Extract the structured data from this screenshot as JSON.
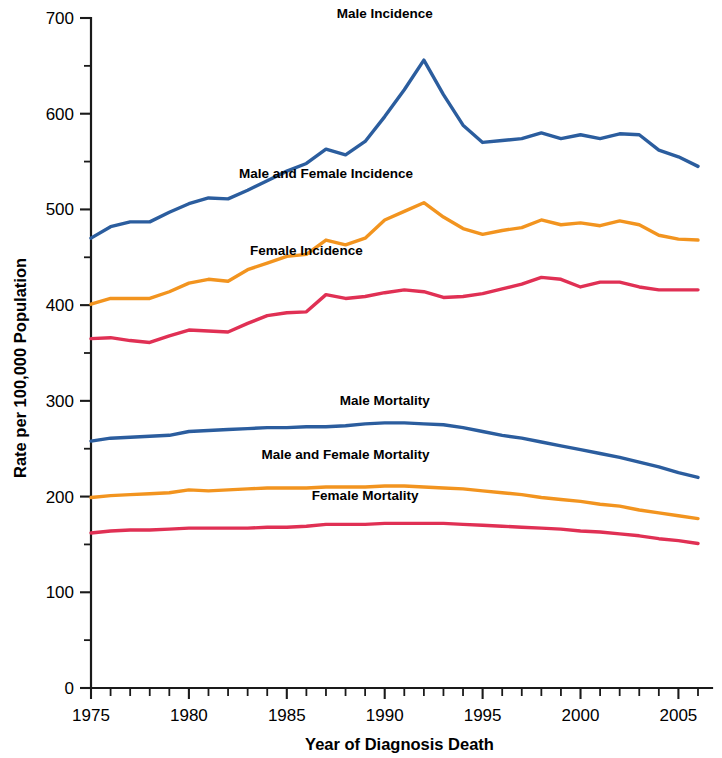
{
  "chart_data": {
    "type": "line",
    "title": "",
    "xlabel": "Year of Diagnosis Death",
    "ylabel": "Rate per 100,000 Population",
    "xlim": [
      1975,
      2006
    ],
    "ylim": [
      0,
      700
    ],
    "ytick_step": 100,
    "yticks": [
      0,
      100,
      200,
      300,
      400,
      500,
      600,
      700
    ],
    "yticklabels": [
      "0",
      "100",
      "200",
      "300",
      "400",
      "500",
      "600",
      "700"
    ],
    "yminor_step": 50,
    "xticks": [
      1975,
      1980,
      1985,
      1990,
      1995,
      2000,
      2005
    ],
    "xticklabels": [
      "1975",
      "1980",
      "1985",
      "1990",
      "1995",
      "2000",
      "2005"
    ],
    "xminor_step": 1,
    "grid": false,
    "legend": "inline-annotations",
    "x": [
      1975,
      1976,
      1977,
      1978,
      1979,
      1980,
      1981,
      1982,
      1983,
      1984,
      1985,
      1986,
      1987,
      1988,
      1989,
      1990,
      1991,
      1992,
      1993,
      1994,
      1995,
      1996,
      1997,
      1998,
      1999,
      2000,
      2001,
      2002,
      2003,
      2004,
      2005,
      2006
    ],
    "series": [
      {
        "name": "Male Incidence",
        "color": "#2b5d9e",
        "label_x": 1990,
        "label_y": 700,
        "values": [
          470,
          482,
          487,
          487,
          497,
          506,
          512,
          511,
          520,
          530,
          540,
          548,
          563,
          557,
          571,
          597,
          625,
          656,
          620,
          588,
          570,
          572,
          574,
          580,
          574,
          578,
          574,
          579,
          578,
          562,
          555,
          545
        ]
      },
      {
        "name": "Male and Female Incidence",
        "color": "#f2941f",
        "label_x": 1987,
        "label_y": 533,
        "values": [
          401,
          407,
          407,
          407,
          414,
          423,
          427,
          425,
          437,
          444,
          451,
          453,
          468,
          463,
          470,
          489,
          498,
          507,
          492,
          480,
          474,
          478,
          481,
          489,
          484,
          486,
          483,
          488,
          484,
          473,
          469,
          468
        ]
      },
      {
        "name": "Female Incidence",
        "color": "#e03054",
        "label_x": 1986,
        "label_y": 452,
        "values": [
          365,
          366,
          363,
          361,
          368,
          374,
          373,
          372,
          381,
          389,
          392,
          393,
          411,
          407,
          409,
          413,
          416,
          414,
          408,
          409,
          412,
          417,
          422,
          429,
          427,
          419,
          424,
          424,
          419,
          416,
          416,
          416
        ]
      },
      {
        "name": "Male Mortality",
        "color": "#2b5d9e",
        "label_x": 1990,
        "label_y": 296,
        "values": [
          258,
          261,
          262,
          263,
          264,
          268,
          269,
          270,
          271,
          272,
          272,
          273,
          273,
          274,
          276,
          277,
          277,
          276,
          275,
          272,
          268,
          264,
          261,
          257,
          253,
          249,
          245,
          241,
          236,
          231,
          225,
          220
        ]
      },
      {
        "name": "Male and Female Mortality",
        "color": "#f2941f",
        "label_x": 1988,
        "label_y": 239,
        "values": [
          199,
          201,
          202,
          203,
          204,
          207,
          206,
          207,
          208,
          209,
          209,
          209,
          210,
          210,
          210,
          211,
          211,
          210,
          209,
          208,
          206,
          204,
          202,
          199,
          197,
          195,
          192,
          190,
          186,
          183,
          180,
          177
        ]
      },
      {
        "name": "Female Mortality",
        "color": "#e03054",
        "label_x": 1989,
        "label_y": 196,
        "values": [
          162,
          164,
          165,
          165,
          166,
          167,
          167,
          167,
          167,
          168,
          168,
          169,
          171,
          171,
          171,
          172,
          172,
          172,
          172,
          171,
          170,
          169,
          168,
          167,
          166,
          164,
          163,
          161,
          159,
          156,
          154,
          151
        ]
      }
    ]
  }
}
